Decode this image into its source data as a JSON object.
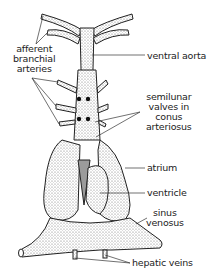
{
  "diagram": {
    "labels": {
      "afferent": [
        "afferent",
        "branchial",
        "arteries"
      ],
      "ventral_aorta": "ventral aorta",
      "semilunar": [
        "semilunar",
        "valves in",
        "conus",
        "arteriosus"
      ],
      "atrium": "atrium",
      "ventricle": "ventricle",
      "sinus": [
        "sinus",
        "venosus"
      ],
      "hepatic": "hepatic veins"
    },
    "colors": {
      "ink": "#222222",
      "stipple": "#8a8a8a",
      "background": "#ffffff"
    }
  }
}
